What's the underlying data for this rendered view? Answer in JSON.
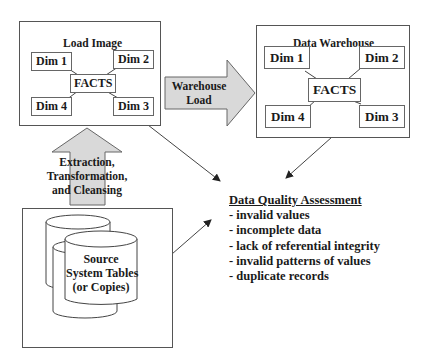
{
  "load_image": {
    "title": "Load Image",
    "facts": "FACTS",
    "dims": [
      "Dim 1",
      "Dim 2",
      "Dim 3",
      "Dim 4"
    ]
  },
  "data_warehouse": {
    "title": "Data Warehouse",
    "facts": "FACTS",
    "dims": [
      "Dim 1",
      "Dim 2",
      "Dim 3",
      "Dim 4"
    ]
  },
  "warehouse_load_arrow": {
    "lines": [
      "Warehouse",
      "Load"
    ],
    "fill": "#d9d9d9"
  },
  "etl_arrow": {
    "lines": [
      "Extraction,",
      "Transformation,",
      "and Cleansing"
    ],
    "fill": "#d9d9d9"
  },
  "source": {
    "lines": [
      "Source",
      "System Tables",
      "(or Copies)"
    ]
  },
  "data_quality": {
    "heading": "Data Quality Assessment",
    "items": [
      "- invalid values",
      "- incomplete data",
      "- lack of referential integrity",
      "- invalid patterns of values",
      "- duplicate records"
    ]
  }
}
